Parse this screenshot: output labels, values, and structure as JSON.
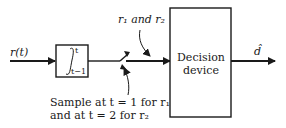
{
  "diagram": {
    "input_label": "r(t)",
    "integrator": {
      "upper_limit": "t",
      "lower_limit": "t−1",
      "symbol": "∫"
    },
    "switch_label_top": "r₁ and r₂",
    "sample_note_line1": "Sample at t = 1 for r₁",
    "sample_note_line2": "and at t = 2 for r₂",
    "decision_block_line1": "Decision",
    "decision_block_line2": "device",
    "output_label": "d̂"
  }
}
